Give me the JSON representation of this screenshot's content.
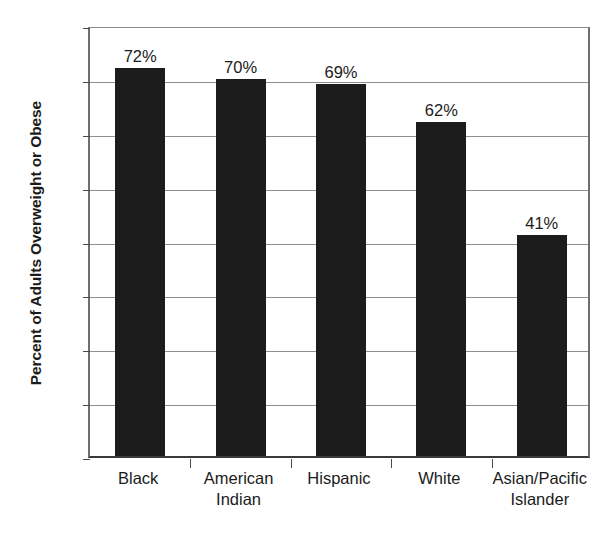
{
  "chart_data": {
    "type": "bar",
    "title": "",
    "xlabel": "",
    "ylabel": "Percent of Adults Overweight or Obese",
    "categories": [
      "Black",
      "American\nIndian",
      "Hispanic",
      "White",
      "Asian/Pacific\nIslander"
    ],
    "values": [
      72,
      70,
      69,
      62,
      41
    ],
    "data_labels": [
      "72%",
      "70%",
      "69%",
      "62%",
      "41%"
    ],
    "ylim": [
      0,
      80
    ],
    "ytick_labels": [
      "80",
      "70",
      "60",
      "50",
      "40",
      "30",
      "20",
      "10",
      "0"
    ],
    "ytick_values": [
      80,
      70,
      60,
      50,
      40,
      30,
      20,
      10,
      0
    ],
    "grid": true,
    "legend": "none",
    "bar_color": "#1c1c1c",
    "gridline_color": "#8f8f8f",
    "axis_color": "#4a4a4a",
    "background_color": "#ffffff"
  }
}
